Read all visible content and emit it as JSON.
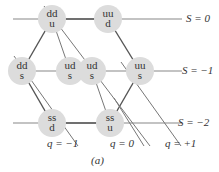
{
  "diagram": {
    "nodes": [
      {
        "top": "dd",
        "bottom": "u",
        "x": 52,
        "y": 19
      },
      {
        "top": "uu",
        "bottom": "d",
        "x": 108,
        "y": 19
      },
      {
        "top": "dd",
        "bottom": "s",
        "x": 22,
        "y": 71
      },
      {
        "top": "ud",
        "bottom": "s",
        "x": 70,
        "y": 71
      },
      {
        "top": "ud",
        "bottom": "s",
        "x": 92,
        "y": 71
      },
      {
        "top": "uu",
        "bottom": "s",
        "x": 140,
        "y": 71
      },
      {
        "top": "ss",
        "bottom": "d",
        "x": 52,
        "y": 123
      },
      {
        "top": "ss",
        "bottom": "u",
        "x": 110,
        "y": 123
      }
    ],
    "strangeness_labels": [
      "S = 0",
      "S = −1",
      "S = −2"
    ],
    "charge_labels": [
      "q = −1",
      "q = 0",
      "q = +1"
    ],
    "caption": "(a)"
  }
}
